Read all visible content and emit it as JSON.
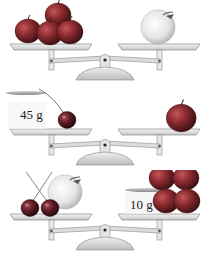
{
  "figure": {
    "type": "balance-scale puzzle",
    "scales": [
      {
        "id": "scale-1",
        "left_pan": {
          "items": [
            "red-apple",
            "red-apple",
            "red-apple",
            "red-apple"
          ]
        },
        "right_pan": {
          "items": [
            "pale-fruit"
          ]
        },
        "state": "balanced"
      },
      {
        "id": "scale-2",
        "left_pan": {
          "items": [
            "weight",
            "cherry"
          ],
          "weight_label": "45 g"
        },
        "right_pan": {
          "items": [
            "red-apple"
          ]
        },
        "state": "balanced"
      },
      {
        "id": "scale-3",
        "left_pan": {
          "items": [
            "cherry",
            "cherry",
            "pale-fruit"
          ]
        },
        "right_pan": {
          "items": [
            "weight",
            "red-apple",
            "red-apple",
            "red-apple",
            "red-apple"
          ],
          "weight_label": "10 g"
        },
        "state": "balanced"
      }
    ]
  },
  "colors": {
    "apple_red": "#8a2a2e",
    "apple_dark": "#4a1518",
    "pale_fruit": "#e6e6e6",
    "scale_metal": "#d8d8d8",
    "scale_edge": "#6a6a6a",
    "weight_plate": "#9a9a9a"
  }
}
